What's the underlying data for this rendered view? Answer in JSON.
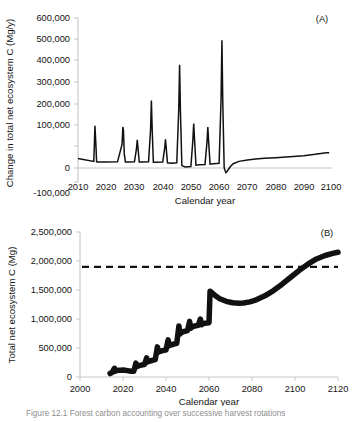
{
  "figure": {
    "caption": "Figure 12.1  Forest carbon accounting over successive harvest rotations",
    "panels": [
      "A",
      "B"
    ]
  },
  "panelA": {
    "label": "(A)",
    "ylabel": "Change in total net ecosystem C (Mg/y)",
    "xlabel": "Calendar year",
    "yticks": [
      "-100,000",
      "0",
      "100,000",
      "200,000",
      "300,000",
      "400,000",
      "500,000",
      "600,000"
    ],
    "xticks": [
      "2010",
      "2020",
      "2030",
      "2040",
      "2050",
      "2060",
      "2070",
      "2080",
      "2090",
      "2100"
    ]
  },
  "panelB": {
    "label": "(B)",
    "ylabel": "Total net ecosystem C (Mg)",
    "xlabel": "Calendar year",
    "yticks": [
      "0",
      "500,000",
      "1,000,000",
      "1,500,000",
      "2,000,000",
      "2,500,000"
    ],
    "xticks": [
      "2000",
      "2020",
      "2040",
      "2060",
      "2080",
      "2100",
      "2120"
    ]
  },
  "style": {
    "line_color": "#111111",
    "axis_color": "#bdbdbd",
    "text_color": "#141414"
  },
  "chart_data": [
    {
      "type": "line",
      "id": "panel-a",
      "title": "(A)",
      "xlabel": "Calendar year",
      "ylabel": "Change in total net ecosystem C (Mg/y)",
      "xlim": [
        2010,
        2100
      ],
      "ylim": [
        -100000,
        600000
      ],
      "xticks": [
        2010,
        2020,
        2030,
        2040,
        2050,
        2060,
        2070,
        2080,
        2090,
        2100
      ],
      "yticks": [
        -100000,
        0,
        100000,
        200000,
        300000,
        400000,
        500000,
        600000
      ],
      "grid": false,
      "legend": "none",
      "annotations": [
        "Spikes correspond to harvest / regrowth pulses at roughly 5-year intervals",
        "Baseline between spikes sits slightly below zero (about -15,000 Mg/y)"
      ],
      "series": [
        {
          "name": "Change in total net ecosystem C",
          "x": [
            2010,
            2015.6,
            2015.8,
            2016.0,
            2016.3,
            2016.6,
            2017,
            2020,
            2024,
            2025.6,
            2025.9,
            2026.1,
            2026.4,
            2026.8,
            2028,
            2030,
            2030.7,
            2031.0,
            2031.3,
            2031.7,
            2033,
            2035,
            2035.7,
            2036.0,
            2036.3,
            2036.7,
            2038,
            2040,
            2040.7,
            2041.0,
            2041.3,
            2041.7,
            2043,
            2045,
            2045.7,
            2046.0,
            2046.3,
            2046.8,
            2048,
            2050,
            2050.7,
            2051.0,
            2051.3,
            2051.8,
            2053,
            2055,
            2055.7,
            2056.0,
            2056.3,
            2056.8,
            2058,
            2060,
            2060.7,
            2061.0,
            2061.3,
            2061.8,
            2062.4,
            2063.0,
            2064,
            2065,
            2067,
            2070,
            2073,
            2076,
            2080,
            2085,
            2090,
            2094,
            2096,
            2098,
            2099
          ],
          "y": [
            0,
            -12000,
            60000,
            140000,
            70000,
            -14000,
            -15000,
            -15000,
            -14000,
            60000,
            135000,
            120000,
            20000,
            -15000,
            -15000,
            -14000,
            40000,
            80000,
            40000,
            -15000,
            -15000,
            -14000,
            120000,
            248000,
            120000,
            -16000,
            -16000,
            -15000,
            42000,
            82000,
            40000,
            -18000,
            -20000,
            -18000,
            210000,
            400000,
            200000,
            -30000,
            -36000,
            -34000,
            78000,
            150000,
            80000,
            -28000,
            -26000,
            -25000,
            70000,
            135000,
            70000,
            -24000,
            -22000,
            -20000,
            260000,
            505000,
            240000,
            -40000,
            -60000,
            -52000,
            -34000,
            -22000,
            -12000,
            -6000,
            -2000,
            1000,
            4000,
            8000,
            12000,
            18000,
            22000,
            25000,
            25000
          ]
        }
      ]
    },
    {
      "type": "line",
      "id": "panel-b",
      "title": "(B)",
      "xlabel": "Calendar year",
      "ylabel": "Total net ecosystem C (Mg)",
      "xlim": [
        2000,
        2120
      ],
      "ylim": [
        0,
        2500000
      ],
      "xticks": [
        2000,
        2020,
        2040,
        2060,
        2080,
        2100,
        2120
      ],
      "yticks": [
        0,
        500000,
        1000000,
        1500000,
        2000000,
        2500000
      ],
      "grid": false,
      "legend": "none",
      "annotations": [
        "Dashed horizontal reference line at 1,900,000 Mg",
        "Sawtooth accumulation to 2060, decline to a minimum near 2075, then sustained rise"
      ],
      "reference_lines": [
        {
          "name": "reference",
          "orientation": "horizontal",
          "value": 1900000,
          "style": "dashed"
        }
      ],
      "series": [
        {
          "name": "Total net ecosystem C",
          "x": [
            2014,
            2015,
            2016,
            2016.5,
            2017,
            2018,
            2019,
            2020,
            2021,
            2022,
            2023,
            2024,
            2025,
            2026,
            2026.5,
            2027,
            2028,
            2029,
            2030,
            2031,
            2031.5,
            2032,
            2033,
            2034,
            2035,
            2036,
            2036.5,
            2037,
            2038,
            2039,
            2040,
            2041,
            2041.5,
            2042,
            2043,
            2044,
            2045,
            2046,
            2046.5,
            2047,
            2048,
            2049,
            2050,
            2051,
            2051.5,
            2052,
            2053,
            2054,
            2055,
            2056,
            2056.5,
            2057,
            2058,
            2059,
            2060,
            2060.5,
            2061,
            2063,
            2065,
            2068,
            2071,
            2074,
            2076,
            2079,
            2082,
            2086,
            2090,
            2094,
            2098,
            2102,
            2106,
            2110,
            2114,
            2118,
            2120
          ],
          "y": [
            60000,
            80000,
            150000,
            100000,
            110000,
            115000,
            118000,
            120000,
            115000,
            110000,
            105000,
            100000,
            98000,
            240000,
            180000,
            190000,
            200000,
            210000,
            215000,
            330000,
            260000,
            270000,
            280000,
            290000,
            300000,
            520000,
            430000,
            440000,
            450000,
            460000,
            465000,
            640000,
            540000,
            550000,
            560000,
            570000,
            580000,
            880000,
            740000,
            760000,
            780000,
            790000,
            800000,
            960000,
            840000,
            860000,
            875000,
            885000,
            890000,
            1000000,
            900000,
            915000,
            925000,
            930000,
            935000,
            1480000,
            1465000,
            1400000,
            1350000,
            1305000,
            1280000,
            1272000,
            1275000,
            1295000,
            1330000,
            1400000,
            1490000,
            1600000,
            1720000,
            1840000,
            1945000,
            2035000,
            2095000,
            2135000,
            2150000
          ]
        }
      ]
    }
  ]
}
